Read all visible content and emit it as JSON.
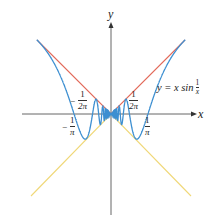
{
  "figure": {
    "width": 213,
    "height": 217,
    "origin_px": [
      111,
      114
    ],
    "unit_px": 116
  },
  "axes": {
    "x_label": "x",
    "y_label": "y",
    "axis_color": "#555555"
  },
  "curves": [
    {
      "name": "y = x sin(1/x)",
      "color": "#3d8fd1",
      "x_range": [
        -0.64,
        0.64
      ]
    },
    {
      "name": "y = |x|",
      "color": "#e26a5a",
      "x_range": [
        -0.64,
        0.64
      ]
    },
    {
      "name": "y = -|x|",
      "color": "#f0d878",
      "x_range": [
        -0.69,
        0.69
      ]
    }
  ],
  "labels": {
    "curve_label": {
      "prefix": "y = x sin",
      "num": "1",
      "den": "x"
    },
    "tick_neg_inv_2pi": {
      "sign": "−",
      "num": "1",
      "den": "2π"
    },
    "tick_pos_inv_2pi": {
      "num": "1",
      "den": "2π"
    },
    "tick_neg_inv_pi": {
      "sign": "−",
      "num": "1",
      "den": "π"
    },
    "tick_pos_inv_pi": {
      "num": "1",
      "den": "π"
    }
  }
}
